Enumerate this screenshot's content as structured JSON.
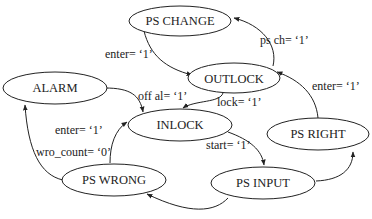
{
  "diagram": {
    "type": "state-machine",
    "states": [
      {
        "id": "ps_change",
        "label": "PS CHANGE"
      },
      {
        "id": "outlock",
        "label": "OUTLOCK"
      },
      {
        "id": "alarm",
        "label": "ALARM"
      },
      {
        "id": "inlock",
        "label": "INLOCK"
      },
      {
        "id": "ps_right",
        "label": "PS RIGHT"
      },
      {
        "id": "ps_wrong",
        "label": "PS WRONG"
      },
      {
        "id": "ps_input",
        "label": "PS INPUT"
      }
    ],
    "transitions": [
      {
        "from": "outlock",
        "to": "ps_change",
        "label": "ps ch=  ‘1’"
      },
      {
        "from": "ps_change",
        "to": "outlock",
        "label": "enter=  ‘1’"
      },
      {
        "from": "alarm",
        "to": "inlock",
        "label": "off al=  ‘1’"
      },
      {
        "from": "outlock",
        "to": "inlock",
        "label": "lock=  ‘1’"
      },
      {
        "from": "ps_right",
        "to": "outlock",
        "label": "enter=  ‘1’"
      },
      {
        "from": "inlock",
        "to": "ps_input",
        "label": "start=  ‘1’"
      },
      {
        "from": "ps_wrong",
        "to": "inlock",
        "label_line1": "enter=  ‘1’",
        "label_line2": "wro_count=  ‘0’"
      },
      {
        "from": "ps_wrong",
        "to": "alarm",
        "label": ""
      },
      {
        "from": "ps_input",
        "to": "ps_right",
        "label": ""
      },
      {
        "from": "ps_input",
        "to": "ps_wrong",
        "label": ""
      }
    ],
    "colors": {
      "stroke": "#222222",
      "background": "#ffffff"
    }
  }
}
